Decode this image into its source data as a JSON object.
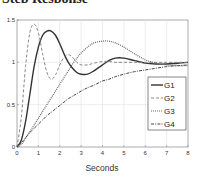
{
  "title": "Step Response",
  "chart_data": {
    "type": "line",
    "title": "Step Response",
    "xlabel": "Seconds",
    "ylabel": "",
    "xlim": [
      0,
      8
    ],
    "ylim": [
      0,
      1.5
    ],
    "xticks": [
      0,
      1,
      2,
      3,
      4,
      5,
      6,
      7,
      8
    ],
    "yticks": [
      0,
      0.5,
      1,
      1.5
    ],
    "ytick_labels": [
      "0",
      "0.5",
      "1",
      "1.5"
    ],
    "grid": true,
    "legend_position": "lower right",
    "x": [
      0,
      0.2,
      0.4,
      0.6,
      0.8,
      1.0,
      1.2,
      1.4,
      1.6,
      1.8,
      2.0,
      2.2,
      2.4,
      2.6,
      2.8,
      3.0,
      3.3,
      3.6,
      4.0,
      4.3,
      4.6,
      5.0,
      5.5,
      6.0,
      6.5,
      7.0,
      7.5,
      8.0
    ],
    "series": [
      {
        "name": "G1",
        "style": "solid",
        "color": "#333333",
        "values": [
          0,
          0.08,
          0.3,
          0.62,
          0.95,
          1.18,
          1.32,
          1.37,
          1.37,
          1.32,
          1.22,
          1.1,
          1.0,
          0.93,
          0.88,
          0.86,
          0.86,
          0.9,
          0.97,
          1.02,
          1.05,
          1.05,
          1.02,
          0.99,
          0.98,
          0.98,
          0.99,
          1.0
        ]
      },
      {
        "name": "G2",
        "style": "dashed",
        "color": "#888888",
        "values": [
          0,
          0.35,
          0.95,
          1.35,
          1.45,
          1.35,
          1.1,
          0.88,
          0.8,
          0.85,
          0.97,
          1.06,
          1.09,
          1.06,
          1.0,
          0.97,
          0.97,
          0.99,
          1.01,
          1.01,
          1.0,
          1.0,
          1.0,
          1.0,
          1.0,
          1.0,
          1.0,
          1.0
        ]
      },
      {
        "name": "G3",
        "style": "dotted",
        "color": "#666666",
        "values": [
          0,
          0.03,
          0.1,
          0.18,
          0.26,
          0.34,
          0.42,
          0.5,
          0.58,
          0.66,
          0.74,
          0.82,
          0.9,
          0.98,
          1.05,
          1.11,
          1.18,
          1.23,
          1.25,
          1.25,
          1.23,
          1.18,
          1.1,
          1.03,
          0.99,
          0.97,
          0.96,
          0.96
        ]
      },
      {
        "name": "G4",
        "style": "dashdot",
        "color": "#444444",
        "values": [
          0,
          0.05,
          0.11,
          0.17,
          0.22,
          0.27,
          0.32,
          0.37,
          0.41,
          0.45,
          0.49,
          0.53,
          0.57,
          0.6,
          0.63,
          0.66,
          0.7,
          0.73,
          0.78,
          0.8,
          0.83,
          0.86,
          0.89,
          0.91,
          0.93,
          0.95,
          0.96,
          0.97
        ]
      }
    ]
  }
}
